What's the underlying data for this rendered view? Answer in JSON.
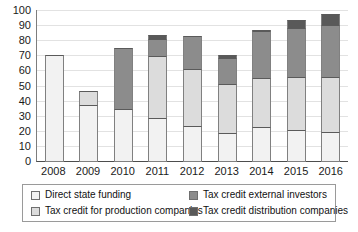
{
  "chart_data": {
    "type": "bar",
    "stacked": true,
    "title": "",
    "xlabel": "",
    "ylabel": "",
    "ylim": [
      0,
      100
    ],
    "ytick_step": 10,
    "grid": true,
    "legend_position": "bottom",
    "categories": [
      "2008",
      "2009",
      "2010",
      "2011",
      "2012",
      "2013",
      "2014",
      "2015",
      "2016"
    ],
    "yticks": [
      "100",
      "90",
      "80",
      "70",
      "60",
      "50",
      "40",
      "30",
      "20",
      "10",
      "0"
    ],
    "series": [
      {
        "name": "Direct state funding",
        "color": "#f2f2f2",
        "values": [
          71,
          38,
          35,
          29,
          24,
          19,
          23,
          21,
          20
        ]
      },
      {
        "name": "Tax credit for production companies",
        "color": "#dcdcdc",
        "values": [
          0,
          10,
          0,
          42,
          38,
          33,
          33,
          36,
          37
        ]
      },
      {
        "name": "Tax credit external investors",
        "color": "#8c8c8c",
        "values": [
          0,
          0,
          41,
          12,
          23,
          18,
          32,
          33,
          35
        ]
      },
      {
        "name": "Tax credit distribution companies",
        "color": "#595959",
        "values": [
          0,
          0,
          0,
          3,
          0,
          3,
          1,
          6,
          8
        ]
      }
    ],
    "totals": [
      71,
      48,
      76,
      86,
      85,
      73,
      89,
      96,
      100
    ]
  },
  "legend": {
    "items": [
      {
        "label": "Direct state funding",
        "color": "#f2f2f2"
      },
      {
        "label": "Tax credit for production companies",
        "color": "#dcdcdc"
      },
      {
        "label": "Tax credit external investors",
        "color": "#8c8c8c"
      },
      {
        "label": "Tax credit distribution companies",
        "color": "#595959"
      }
    ]
  }
}
